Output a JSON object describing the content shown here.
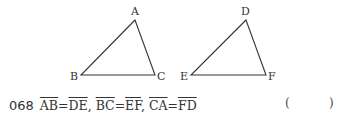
{
  "figure": {
    "triangle1": {
      "labels": {
        "A": "A",
        "B": "B",
        "C": "C"
      }
    },
    "triangle2": {
      "labels": {
        "D": "D",
        "E": "E",
        "F": "F"
      }
    },
    "stroke_color": "#333333"
  },
  "problem": {
    "number": "068",
    "segments": [
      {
        "seg": "AB",
        "eq": "=",
        "seg2": "DE",
        "sep": ", "
      },
      {
        "seg": "BC",
        "eq": "=",
        "seg2": "EF",
        "sep": ", "
      },
      {
        "seg": "CA",
        "eq": "=",
        "seg2": "FD",
        "sep": ""
      }
    ],
    "answer_open": "(",
    "answer_close": ")"
  }
}
